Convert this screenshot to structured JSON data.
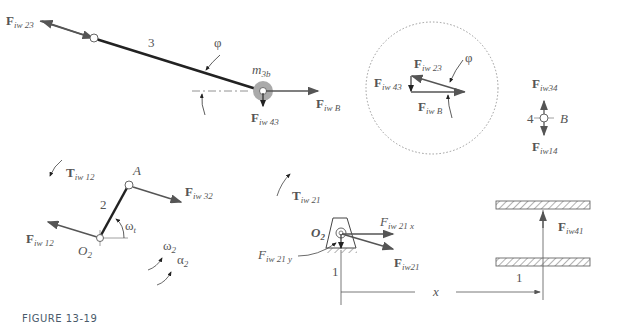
{
  "figure": {
    "caption": "FIGURE 13-19",
    "colors": {
      "link": "#222222",
      "force": "#555555",
      "mass": "#aaaaaa",
      "circle": "#999999"
    }
  },
  "link3": {
    "number": "3",
    "angle": "φ",
    "mass": "m",
    "mass_sub": "3b",
    "forces": [
      {
        "main": "F",
        "sub": "iw 23"
      },
      {
        "main": "F",
        "sub": "iw B"
      },
      {
        "main": "F",
        "sub": "iw 43"
      }
    ]
  },
  "polygon": {
    "angle": "φ",
    "forces": [
      {
        "main": "F",
        "sub": "iw 23"
      },
      {
        "main": "F",
        "sub": "iw 43"
      },
      {
        "main": "F",
        "sub": "iw B"
      }
    ]
  },
  "link4": {
    "number": "4",
    "point": "B",
    "forces": [
      {
        "main": "F",
        "sub": "iw34"
      },
      {
        "main": "F",
        "sub": "iw14"
      }
    ]
  },
  "link2": {
    "number": "2",
    "point_a": "A",
    "pivot": "O",
    "pivot_sub": "2",
    "angle": "ω",
    "angle_sub": "t",
    "omega": "ω",
    "omega_sub": "2",
    "alpha": "α",
    "alpha_sub": "2",
    "torque": {
      "main": "T",
      "sub": "iw 12"
    },
    "forces": [
      {
        "main": "F",
        "sub": "iw 32"
      },
      {
        "main": "F",
        "sub": "iw 12"
      }
    ]
  },
  "ground": {
    "number": "1",
    "number2": "1",
    "pivot": "O",
    "pivot_sub": "2",
    "torque": {
      "main": "T",
      "sub": "iw 21"
    },
    "forces": [
      {
        "main": "F",
        "sub": "iw 21 x"
      },
      {
        "main": "F",
        "sub": "iw 21 y"
      },
      {
        "main": "F",
        "sub": "iw21"
      },
      {
        "main": "F",
        "sub": "iw41"
      }
    ],
    "distance": "x"
  }
}
